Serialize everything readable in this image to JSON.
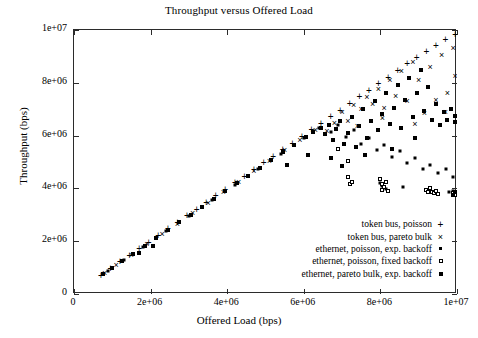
{
  "chart_data": {
    "type": "scatter",
    "title": "Throughput versus Offered Load",
    "xlabel": "Offered Load (bps)",
    "ylabel": "Throughput (bps)",
    "xlim": [
      0,
      10000000
    ],
    "ylim": [
      0,
      10000000
    ],
    "grid": false,
    "legend_position": "lower-right inside",
    "xticks": [
      0,
      2000000,
      4000000,
      6000000,
      8000000,
      10000000
    ],
    "xticklabels": [
      "0",
      "2e+06",
      "4e+06",
      "6e+06",
      "8e+06",
      "1e+07"
    ],
    "yticks": [
      0,
      2000000,
      4000000,
      6000000,
      8000000,
      10000000
    ],
    "yticklabels": [
      "0",
      "2e+06",
      "4e+06",
      "6e+06",
      "8e+06",
      "1e+07"
    ],
    "series": [
      {
        "name": "token bus, poisson",
        "marker": "plus",
        "points": [
          [
            700000,
            700000
          ],
          [
            950000,
            950000
          ],
          [
            1200000,
            1200000
          ],
          [
            1450000,
            1450000
          ],
          [
            1700000,
            1700000
          ],
          [
            1950000,
            1950000
          ],
          [
            2200000,
            2200000
          ],
          [
            2450000,
            2450000
          ],
          [
            2700000,
            2700000
          ],
          [
            2950000,
            2950000
          ],
          [
            3200000,
            3200000
          ],
          [
            3450000,
            3450000
          ],
          [
            3700000,
            3700000
          ],
          [
            3950000,
            3950000
          ],
          [
            4200000,
            4200000
          ],
          [
            4450000,
            4450000
          ],
          [
            4700000,
            4700000
          ],
          [
            4950000,
            4950000
          ],
          [
            5200000,
            5200000
          ],
          [
            5450000,
            5450000
          ],
          [
            5700000,
            5700000
          ],
          [
            5950000,
            5950000
          ],
          [
            6200000,
            6200000
          ],
          [
            6450000,
            6450000
          ],
          [
            6700000,
            6700000
          ],
          [
            6950000,
            6950000
          ],
          [
            7200000,
            7200000
          ],
          [
            7450000,
            7450000
          ],
          [
            7700000,
            7700000
          ],
          [
            7950000,
            7950000
          ],
          [
            8200000,
            8200000
          ],
          [
            8450000,
            8450000
          ],
          [
            8700000,
            8700000
          ],
          [
            8950000,
            8950000
          ],
          [
            9200000,
            9180000
          ],
          [
            9450000,
            9400000
          ],
          [
            9700000,
            9620000
          ],
          [
            9950000,
            9820000
          ]
        ]
      },
      {
        "name": "token bus, pareto bulk",
        "marker": "cross",
        "points": [
          [
            800000,
            790000
          ],
          [
            1100000,
            1090000
          ],
          [
            1500000,
            1480000
          ],
          [
            1900000,
            1880000
          ],
          [
            2300000,
            2270000
          ],
          [
            2700000,
            2660000
          ],
          [
            3100000,
            3060000
          ],
          [
            3500000,
            3450000
          ],
          [
            3900000,
            3860000
          ],
          [
            4300000,
            4250000
          ],
          [
            4700000,
            4650000
          ],
          [
            5100000,
            5050000
          ],
          [
            5500000,
            5440000
          ],
          [
            5900000,
            5840000
          ],
          [
            6300000,
            6230000
          ],
          [
            6600000,
            6180000
          ],
          [
            6800000,
            6480000
          ],
          [
            7000000,
            6900000
          ],
          [
            7150000,
            6550000
          ],
          [
            7300000,
            7150000
          ],
          [
            7500000,
            7000000
          ],
          [
            7650000,
            7450000
          ],
          [
            7800000,
            7200000
          ],
          [
            7950000,
            7750000
          ],
          [
            8100000,
            7050000
          ],
          [
            8250000,
            8100000
          ],
          [
            8400000,
            7500000
          ],
          [
            8550000,
            8450000
          ],
          [
            8700000,
            7300000
          ],
          [
            8850000,
            8800000
          ],
          [
            9000000,
            8100000
          ],
          [
            9150000,
            6850000
          ],
          [
            9300000,
            8600000
          ],
          [
            9450000,
            7350000
          ],
          [
            9600000,
            9050000
          ],
          [
            9750000,
            7600000
          ],
          [
            9900000,
            9300000
          ],
          [
            9950000,
            8250000
          ],
          [
            7400000,
            6350000
          ],
          [
            8050000,
            6650000
          ],
          [
            8900000,
            6450000
          ],
          [
            9700000,
            6900000
          ]
        ]
      },
      {
        "name": "ethernet, poisson, exp. backoff",
        "marker": "dot-square",
        "points": [
          [
            900000,
            890000
          ],
          [
            1300000,
            1290000
          ],
          [
            1800000,
            1780000
          ],
          [
            2400000,
            2370000
          ],
          [
            3000000,
            2960000
          ],
          [
            3600000,
            3550000
          ],
          [
            4200000,
            4140000
          ],
          [
            4800000,
            4730000
          ],
          [
            5400000,
            5320000
          ],
          [
            6000000,
            5900000
          ],
          [
            6400000,
            6280000
          ],
          [
            6700000,
            6150000
          ],
          [
            6900000,
            6400000
          ],
          [
            7100000,
            5950000
          ],
          [
            7300000,
            6200000
          ],
          [
            7500000,
            5700000
          ],
          [
            7700000,
            5900000
          ],
          [
            7900000,
            5450000
          ],
          [
            8100000,
            5650000
          ],
          [
            8300000,
            5200000
          ],
          [
            8500000,
            5400000
          ],
          [
            8700000,
            4950000
          ],
          [
            8900000,
            5150000
          ],
          [
            9100000,
            4750000
          ],
          [
            9300000,
            4900000
          ],
          [
            9500000,
            4600000
          ],
          [
            9700000,
            4750000
          ],
          [
            9900000,
            4450000
          ],
          [
            8000000,
            4200000
          ],
          [
            8600000,
            4050000
          ],
          [
            9200000,
            3950000
          ],
          [
            9800000,
            3850000
          ],
          [
            9900000,
            3900000
          ],
          [
            8050000,
            4100000
          ],
          [
            8150000,
            3980000
          ]
        ]
      },
      {
        "name": "ethernet, poisson, fixed backoff",
        "marker": "open-square",
        "points": [
          [
            7150000,
            4450000
          ],
          [
            7150000,
            5050000
          ],
          [
            7200000,
            4150000
          ],
          [
            7250000,
            4250000
          ],
          [
            8000000,
            4350000
          ],
          [
            8050000,
            4150000
          ],
          [
            8050000,
            3950000
          ],
          [
            8100000,
            4050000
          ],
          [
            8150000,
            4250000
          ],
          [
            8200000,
            3900000
          ],
          [
            9200000,
            3950000
          ],
          [
            9250000,
            3850000
          ],
          [
            9300000,
            4000000
          ],
          [
            9350000,
            3880000
          ],
          [
            9400000,
            3820000
          ],
          [
            9450000,
            3900000
          ],
          [
            9500000,
            3780000
          ],
          [
            9900000,
            3820000
          ],
          [
            9950000,
            3750000
          ],
          [
            6900000,
            5500000
          ]
        ]
      },
      {
        "name": "ethernet, pareto bulk, exp. backoff",
        "marker": "filled-square",
        "points": [
          [
            750000,
            740000
          ],
          [
            1000000,
            990000
          ],
          [
            1250000,
            1240000
          ],
          [
            1550000,
            1530000
          ],
          [
            1850000,
            1830000
          ],
          [
            2150000,
            2120000
          ],
          [
            2450000,
            2420000
          ],
          [
            2750000,
            2710000
          ],
          [
            3050000,
            3010000
          ],
          [
            3350000,
            3300000
          ],
          [
            3650000,
            3600000
          ],
          [
            3950000,
            3890000
          ],
          [
            4250000,
            4190000
          ],
          [
            4550000,
            4480000
          ],
          [
            4850000,
            4780000
          ],
          [
            5150000,
            5070000
          ],
          [
            5450000,
            5360000
          ],
          [
            5750000,
            5660000
          ],
          [
            6050000,
            5950000
          ],
          [
            6250000,
            6150000
          ],
          [
            6450000,
            6300000
          ],
          [
            6550000,
            6050000
          ],
          [
            6650000,
            6400000
          ],
          [
            6750000,
            5850000
          ],
          [
            6850000,
            6250000
          ],
          [
            6950000,
            6550000
          ],
          [
            7050000,
            5700000
          ],
          [
            7150000,
            6100000
          ],
          [
            7250000,
            6700000
          ],
          [
            7350000,
            5550000
          ],
          [
            7450000,
            6350000
          ],
          [
            7550000,
            7000000
          ],
          [
            7650000,
            5900000
          ],
          [
            7750000,
            6550000
          ],
          [
            7850000,
            7300000
          ],
          [
            7950000,
            6200000
          ],
          [
            8050000,
            6800000
          ],
          [
            8150000,
            7600000
          ],
          [
            8250000,
            6450000
          ],
          [
            8350000,
            7050000
          ],
          [
            8450000,
            7900000
          ],
          [
            8550000,
            6300000
          ],
          [
            8650000,
            7350000
          ],
          [
            8750000,
            8200000
          ],
          [
            8850000,
            6700000
          ],
          [
            8950000,
            7600000
          ],
          [
            9050000,
            8500000
          ],
          [
            9150000,
            6950000
          ],
          [
            9250000,
            7850000
          ],
          [
            9350000,
            6600000
          ],
          [
            9450000,
            7200000
          ],
          [
            9550000,
            6400000
          ],
          [
            9650000,
            6900000
          ],
          [
            9750000,
            6600000
          ],
          [
            9850000,
            7000000
          ],
          [
            9950000,
            6750000
          ],
          [
            9950000,
            6500000
          ],
          [
            5550000,
            4900000
          ],
          [
            6100000,
            5250000
          ],
          [
            6700000,
            5150000
          ],
          [
            7000000,
            4850000
          ],
          [
            7600000,
            5250000
          ],
          [
            8300000,
            5500000
          ],
          [
            8900000,
            5900000
          ],
          [
            2050000,
            1800000
          ],
          [
            1700000,
            1550000
          ],
          [
            9950000,
            3850000
          ],
          [
            9900000,
            3750000
          ]
        ]
      }
    ]
  },
  "legend": {
    "items": [
      {
        "label": "token bus, poisson",
        "marker": "plus"
      },
      {
        "label": "token bus, pareto bulk",
        "marker": "cross"
      },
      {
        "label": "ethernet, poisson, exp. backoff",
        "marker": "dot-square"
      },
      {
        "label": "ethernet, poisson, fixed backoff",
        "marker": "open-square"
      },
      {
        "label": "ethernet, pareto bulk, exp. backoff",
        "marker": "filled-square"
      }
    ]
  }
}
